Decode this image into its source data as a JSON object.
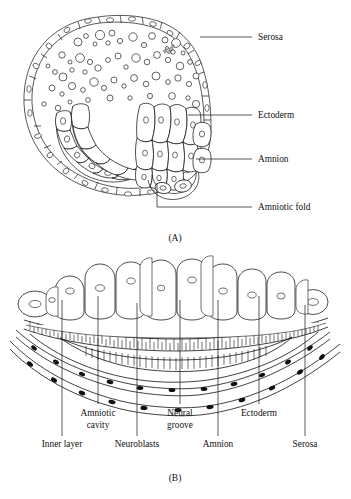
{
  "figure": {
    "panels": [
      {
        "id": "A",
        "caption": "(A)",
        "labels": [
          {
            "key": "serosa",
            "text": "Serosa",
            "x": 258,
            "y": 40,
            "leader": [
              [
                200,
                37
              ],
              [
                252,
                37
              ]
            ]
          },
          {
            "key": "ectoderm",
            "text": "Ectoderm",
            "x": 258,
            "y": 118,
            "leader": [
              [
                188,
                115
              ],
              [
                252,
                115
              ]
            ]
          },
          {
            "key": "amnion",
            "text": "Amnion",
            "x": 258,
            "y": 162,
            "leader": [
              [
                196,
                159
              ],
              [
                252,
                159
              ]
            ]
          },
          {
            "key": "amniotic_fold",
            "text": "Amniotic fold",
            "x": 258,
            "y": 210,
            "leader": [
              [
                157,
                183
              ],
              [
                157,
                207
              ],
              [
                252,
                207
              ]
            ]
          }
        ]
      },
      {
        "id": "B",
        "caption": "(B)",
        "labels": [
          {
            "key": "amniotic_cavity",
            "text": "Amniotic",
            "text2": "cavity",
            "x": 98,
            "y": 416,
            "y2": 428,
            "leader": [
              [
                98,
                296
              ],
              [
                98,
                404
              ]
            ]
          },
          {
            "key": "neural_groove",
            "text": "Neural",
            "text2": "groove",
            "x": 180,
            "y": 416,
            "y2": 428,
            "leader": [
              [
                180,
                300
              ],
              [
                180,
                404
              ]
            ]
          },
          {
            "key": "ectoderm",
            "text": "Ectoderm",
            "x": 259,
            "y": 416,
            "leader": [
              [
                259,
                296
              ],
              [
                259,
                404
              ]
            ]
          },
          {
            "key": "inner_layer",
            "text": "Inner layer",
            "x": 62,
            "y": 447,
            "leader": [
              [
                62,
                300
              ],
              [
                62,
                436
              ]
            ]
          },
          {
            "key": "neuroblasts",
            "text": "Neuroblasts",
            "x": 137,
            "y": 447,
            "leader": [
              [
                137,
                303
              ],
              [
                137,
                436
              ]
            ]
          },
          {
            "key": "amnion",
            "text": "Amnion",
            "x": 218,
            "y": 447,
            "leader": [
              [
                218,
                300
              ],
              [
                218,
                436
              ]
            ]
          },
          {
            "key": "serosa",
            "text": "Serosa",
            "x": 305,
            "y": 447,
            "leader": [
              [
                305,
                305
              ],
              [
                305,
                436
              ]
            ]
          }
        ]
      }
    ],
    "colors": {
      "ink": "#111111",
      "background": "#ffffff",
      "fill": "#ffffff"
    }
  }
}
